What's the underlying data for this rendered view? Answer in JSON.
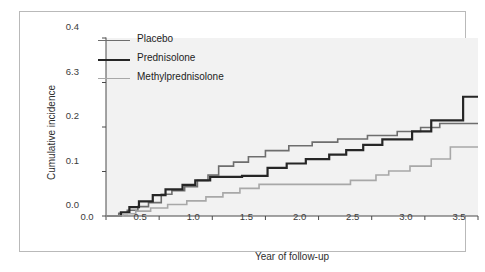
{
  "figure": {
    "background": "#ffffff",
    "panel_background": "#f2f2f2",
    "frame_color": "#b9b9b9"
  },
  "axis": {
    "ylabel": "Cumulative incidence",
    "xlabel": "Year of follow-up",
    "ytick_labels": [
      "0.4",
      "6.3",
      "0.2",
      "0.1",
      "0.0"
    ],
    "xtick_labels": [
      "0.0",
      "0.5",
      "1.0",
      "1.5",
      "2.0",
      "2.5",
      "3.0",
      "3.5"
    ]
  },
  "legend": {
    "items": [
      {
        "label": "Placebo",
        "color": "#6e6e6e",
        "width": 1.6
      },
      {
        "label": "Prednisolone",
        "color": "#262626",
        "width": 2.2
      },
      {
        "label": "Methylprednisolone",
        "color": "#a8a8a8",
        "width": 1.6
      }
    ]
  },
  "chart_data": {
    "type": "line",
    "subtype": "step",
    "title": "",
    "xlabel": "Year of follow-up",
    "ylabel": "Cumulative incidence",
    "xlim": [
      0.0,
      3.5
    ],
    "ylim": [
      0.0,
      0.4
    ],
    "xticks": [
      0.0,
      0.5,
      1.0,
      1.5,
      2.0,
      2.5,
      3.0,
      3.5
    ],
    "yticks": [
      0.0,
      0.1,
      0.2,
      0.3,
      0.4
    ],
    "ytick_labels_as_rendered": [
      "0.0",
      "0.1",
      "0.2",
      "6.3",
      "0.4"
    ],
    "grid": false,
    "legend_position": "upper-left-inside",
    "series": [
      {
        "name": "Placebo",
        "color": "#6e6e6e",
        "linewidth": 1.6,
        "points": [
          [
            0.0,
            0.0
          ],
          [
            0.12,
            0.0
          ],
          [
            0.12,
            0.006
          ],
          [
            0.2,
            0.006
          ],
          [
            0.2,
            0.013
          ],
          [
            0.3,
            0.013
          ],
          [
            0.3,
            0.021
          ],
          [
            0.4,
            0.021
          ],
          [
            0.4,
            0.03
          ],
          [
            0.52,
            0.03
          ],
          [
            0.52,
            0.049
          ],
          [
            0.62,
            0.049
          ],
          [
            0.62,
            0.057
          ],
          [
            0.74,
            0.057
          ],
          [
            0.74,
            0.066
          ],
          [
            0.86,
            0.066
          ],
          [
            0.86,
            0.08
          ],
          [
            0.96,
            0.08
          ],
          [
            0.96,
            0.092
          ],
          [
            1.06,
            0.092
          ],
          [
            1.06,
            0.112
          ],
          [
            1.2,
            0.112
          ],
          [
            1.2,
            0.121
          ],
          [
            1.34,
            0.121
          ],
          [
            1.34,
            0.133
          ],
          [
            1.5,
            0.133
          ],
          [
            1.5,
            0.147
          ],
          [
            1.72,
            0.147
          ],
          [
            1.72,
            0.158
          ],
          [
            1.94,
            0.158
          ],
          [
            1.94,
            0.166
          ],
          [
            2.18,
            0.166
          ],
          [
            2.18,
            0.173
          ],
          [
            2.46,
            0.173
          ],
          [
            2.46,
            0.181
          ],
          [
            2.74,
            0.181
          ],
          [
            2.74,
            0.19
          ],
          [
            2.96,
            0.19
          ],
          [
            2.96,
            0.199
          ],
          [
            3.14,
            0.199
          ],
          [
            3.14,
            0.208
          ],
          [
            3.5,
            0.208
          ]
        ]
      },
      {
        "name": "Prednisolone",
        "color": "#262626",
        "linewidth": 2.2,
        "points": [
          [
            0.0,
            0.0
          ],
          [
            0.14,
            0.0
          ],
          [
            0.14,
            0.008
          ],
          [
            0.22,
            0.008
          ],
          [
            0.22,
            0.02
          ],
          [
            0.31,
            0.02
          ],
          [
            0.31,
            0.033
          ],
          [
            0.44,
            0.033
          ],
          [
            0.44,
            0.047
          ],
          [
            0.56,
            0.047
          ],
          [
            0.56,
            0.06
          ],
          [
            0.72,
            0.06
          ],
          [
            0.72,
            0.07
          ],
          [
            0.84,
            0.07
          ],
          [
            0.84,
            0.08
          ],
          [
            0.98,
            0.08
          ],
          [
            0.98,
            0.088
          ],
          [
            1.28,
            0.088
          ],
          [
            1.28,
            0.09
          ],
          [
            1.52,
            0.09
          ],
          [
            1.52,
            0.108
          ],
          [
            1.7,
            0.108
          ],
          [
            1.7,
            0.118
          ],
          [
            1.88,
            0.118
          ],
          [
            1.88,
            0.128
          ],
          [
            2.1,
            0.128
          ],
          [
            2.1,
            0.138
          ],
          [
            2.26,
            0.138
          ],
          [
            2.26,
            0.148
          ],
          [
            2.42,
            0.148
          ],
          [
            2.42,
            0.16
          ],
          [
            2.6,
            0.16
          ],
          [
            2.6,
            0.172
          ],
          [
            2.88,
            0.172
          ],
          [
            2.88,
            0.19
          ],
          [
            3.06,
            0.19
          ],
          [
            3.06,
            0.215
          ],
          [
            3.36,
            0.215
          ],
          [
            3.36,
            0.268
          ],
          [
            3.5,
            0.268
          ]
        ]
      },
      {
        "name": "Methylprednisolone",
        "color": "#a8a8a8",
        "linewidth": 1.6,
        "points": [
          [
            0.0,
            0.0
          ],
          [
            0.16,
            0.0
          ],
          [
            0.16,
            0.005
          ],
          [
            0.28,
            0.005
          ],
          [
            0.28,
            0.011
          ],
          [
            0.42,
            0.011
          ],
          [
            0.42,
            0.018
          ],
          [
            0.58,
            0.018
          ],
          [
            0.58,
            0.026
          ],
          [
            0.76,
            0.026
          ],
          [
            0.76,
            0.034
          ],
          [
            0.94,
            0.034
          ],
          [
            0.94,
            0.043
          ],
          [
            1.1,
            0.043
          ],
          [
            1.1,
            0.052
          ],
          [
            1.26,
            0.052
          ],
          [
            1.26,
            0.062
          ],
          [
            1.44,
            0.062
          ],
          [
            1.44,
            0.071
          ],
          [
            1.66,
            0.071
          ],
          [
            1.66,
            0.071
          ],
          [
            2.3,
            0.071
          ],
          [
            2.3,
            0.08
          ],
          [
            2.54,
            0.08
          ],
          [
            2.54,
            0.092
          ],
          [
            2.66,
            0.092
          ],
          [
            2.66,
            0.101
          ],
          [
            2.86,
            0.101
          ],
          [
            2.86,
            0.112
          ],
          [
            3.06,
            0.112
          ],
          [
            3.06,
            0.128
          ],
          [
            3.24,
            0.128
          ],
          [
            3.24,
            0.155
          ],
          [
            3.5,
            0.155
          ]
        ]
      }
    ]
  }
}
